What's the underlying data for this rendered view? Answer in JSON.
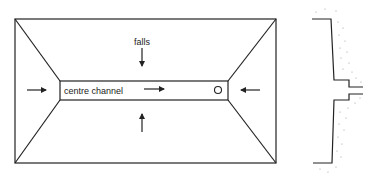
{
  "diagram": {
    "plan_view": {
      "labels": {
        "falls": "falls",
        "centre_channel": "centre channel"
      },
      "arrows": [
        {
          "id": "arrow-left-inward",
          "direction": "right"
        },
        {
          "id": "arrow-right-inward",
          "direction": "left"
        },
        {
          "id": "arrow-top-down",
          "direction": "down"
        },
        {
          "id": "arrow-bottom-up",
          "direction": "up"
        },
        {
          "id": "arrow-channel-flow",
          "direction": "right"
        }
      ],
      "outlet": "circle-outlet"
    },
    "section_view": {
      "description": "cross-section profile with hatched/stippled fill"
    },
    "colors": {
      "line": "#222222",
      "background": "#ffffff",
      "stipple": "#999999"
    }
  }
}
